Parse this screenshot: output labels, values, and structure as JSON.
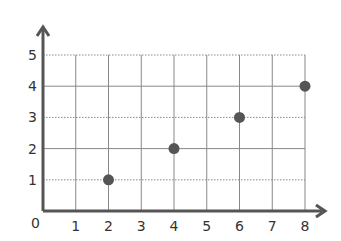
{
  "chart_data": {
    "type": "scatter",
    "title": "",
    "xlabel": "",
    "ylabel": "",
    "x": [
      2,
      4,
      6,
      8
    ],
    "y": [
      1,
      2,
      3,
      4
    ],
    "xlim": [
      0,
      8
    ],
    "ylim": [
      0,
      5
    ],
    "x_ticks": [
      "1",
      "2",
      "3",
      "4",
      "5",
      "6",
      "7",
      "8"
    ],
    "y_ticks": [
      "1",
      "2",
      "3",
      "4",
      "5"
    ],
    "origin_label": "0",
    "grid": true,
    "legend": null,
    "colors": {
      "point": "#555555",
      "axis": "#555555",
      "grid": "#888888"
    }
  }
}
